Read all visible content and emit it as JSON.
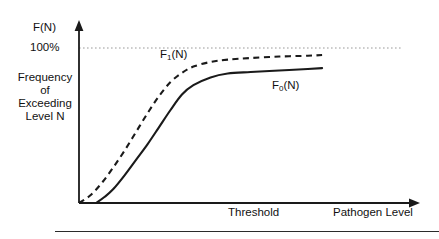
{
  "figure": {
    "title": "",
    "y_axis_label": "F(N)",
    "y_tick_label": "100%",
    "y_axis_description_lines": [
      "Frequency",
      "of",
      "Exceeding",
      "Level N"
    ],
    "x_axis_label": "Pathogen Level",
    "x_axis_marker_label": "Threshold",
    "curve_labels": {
      "dashed": {
        "base": "F",
        "sub": "1",
        "suffix": "(N)",
        "full": "F1(N)"
      },
      "solid": {
        "base": "F",
        "sub": "0",
        "suffix": "(N)",
        "full": "F0(N)"
      }
    },
    "colors": {
      "axis": "#1a1a1a",
      "curve": "#1a1a1a",
      "reference_line": "#9a9a9a",
      "background": "#ffffff",
      "rule": "#2b2b2b"
    }
  },
  "chart_data": {
    "type": "line",
    "title": "",
    "xlabel": "Pathogen Level",
    "ylabel": "F(N)",
    "ylabel_long": "Frequency of Exceeding Level N",
    "xlim": [
      0,
      100
    ],
    "ylim": [
      0,
      110
    ],
    "grid": false,
    "legend": "inline-annotations",
    "axis_ticks_shown": false,
    "annotations": [
      {
        "text": "100%",
        "axis": "y",
        "value": 100
      },
      {
        "text": "Threshold",
        "axis": "x",
        "value": 52
      },
      {
        "text": "F1(N)",
        "series": "F1(N)",
        "x": 31,
        "y": 100
      },
      {
        "text": "F0(N)",
        "series": "F0(N)",
        "x": 60,
        "y": 79
      }
    ],
    "reference_lines": [
      {
        "axis": "y",
        "value": 100,
        "style": "dotted",
        "label": "100%"
      }
    ],
    "series": [
      {
        "name": "F1(N)",
        "style": "dashed",
        "x": [
          0,
          4,
          8,
          12,
          16,
          20,
          24,
          28,
          32,
          36,
          40,
          46,
          52,
          60,
          70,
          80,
          85
        ],
        "y": [
          0,
          5,
          13,
          23,
          34,
          46,
          58,
          69,
          78,
          84,
          88,
          91,
          92.5,
          93.5,
          94.5,
          95,
          95.5
        ]
      },
      {
        "name": "F0(N)",
        "style": "solid",
        "x": [
          6,
          9,
          12,
          16,
          20,
          24,
          28,
          32,
          36,
          40,
          46,
          52,
          60,
          70,
          80,
          85
        ],
        "y": [
          0,
          4,
          9,
          18,
          28,
          38,
          49,
          60,
          70,
          76,
          81,
          83.5,
          84.5,
          85.5,
          86.5,
          87
        ]
      }
    ]
  }
}
